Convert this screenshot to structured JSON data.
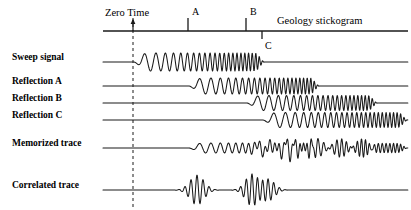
{
  "figure": {
    "title_right": "Geology stickogram",
    "zero_time_label": "Zero Time",
    "width": 411,
    "height": 210,
    "stroke_color": "#1a1a1a"
  },
  "axis": {
    "y": 31,
    "x_start": 103,
    "x_end": 408,
    "zero_time_x": 133,
    "ticks": [
      {
        "name": "A",
        "label": "A",
        "x": 188,
        "direction": "up",
        "length": 13,
        "label_dx": 4,
        "label_dy": -12
      },
      {
        "name": "B",
        "label": "B",
        "x": 246,
        "direction": "up",
        "length": 13,
        "label_dx": 4,
        "label_dy": -12
      },
      {
        "name": "C",
        "label": "C",
        "x": 262,
        "direction": "down",
        "length": 8,
        "label_dx": 3,
        "label_dy": 1
      }
    ],
    "dashed_line": {
      "x": 133,
      "y_top": 18,
      "y_bottom": 207,
      "dash": "3,3"
    }
  },
  "rows": [
    {
      "name": "sweep-signal",
      "label": "Sweep signal",
      "label_x": 12,
      "label_y": 57,
      "baseline_y": 62,
      "trace_x_start": 103,
      "trace_x_end": 408,
      "kind": "chirp",
      "chirp": {
        "x_start": 133,
        "x_end": 265,
        "amplitude": 9,
        "f_start": 0.055,
        "f_end": 0.3,
        "taper_in": 14,
        "taper_out": 10,
        "phase": 3.14159
      }
    },
    {
      "name": "reflection-a",
      "label": "Reflection A",
      "label_x": 12,
      "label_y": 81,
      "baseline_y": 86,
      "trace_x_start": 103,
      "trace_x_end": 408,
      "kind": "chirp",
      "chirp": {
        "x_start": 188,
        "x_end": 320,
        "amplitude": 8,
        "f_start": 0.055,
        "f_end": 0.3,
        "taper_in": 14,
        "taper_out": 10,
        "phase": 3.14159
      }
    },
    {
      "name": "reflection-b",
      "label": "Reflection B",
      "label_x": 12,
      "label_y": 98,
      "baseline_y": 103,
      "trace_x_start": 103,
      "trace_x_end": 408,
      "kind": "chirp",
      "chirp": {
        "x_start": 246,
        "x_end": 378,
        "amplitude": 7.5,
        "f_start": 0.055,
        "f_end": 0.3,
        "taper_in": 14,
        "taper_out": 10,
        "phase": 3.14159
      }
    },
    {
      "name": "reflection-c",
      "label": "Reflection C",
      "label_x": 12,
      "label_y": 115,
      "baseline_y": 120,
      "trace_x_start": 103,
      "trace_x_end": 408,
      "kind": "chirp",
      "chirp": {
        "x_start": 262,
        "x_end": 408,
        "amplitude": 7.5,
        "f_start": 0.055,
        "f_end": 0.3,
        "taper_in": 14,
        "taper_out": 10,
        "phase": 3.14159
      }
    },
    {
      "name": "memorized-trace",
      "label": "Memorized trace",
      "label_x": 12,
      "label_y": 143,
      "baseline_y": 148,
      "trace_x_start": 103,
      "trace_x_end": 408,
      "kind": "sum",
      "sum_of": [
        "reflection-a",
        "reflection-b",
        "reflection-c"
      ],
      "sum_scale": 0.62,
      "sum_amplitude": 13
    },
    {
      "name": "correlated-trace",
      "label": "Correlated trace",
      "label_x": 12,
      "label_y": 185,
      "baseline_y": 190,
      "trace_x_start": 103,
      "trace_x_end": 408,
      "kind": "wavelets",
      "wavelets": [
        {
          "center": 197,
          "amplitude": 15,
          "width": 7.0,
          "frequency": 0.165
        },
        {
          "center": 252,
          "amplitude": 16,
          "width": 6.5,
          "frequency": 0.175
        },
        {
          "center": 268,
          "amplitude": 11,
          "width": 6.5,
          "frequency": 0.175
        }
      ]
    }
  ]
}
